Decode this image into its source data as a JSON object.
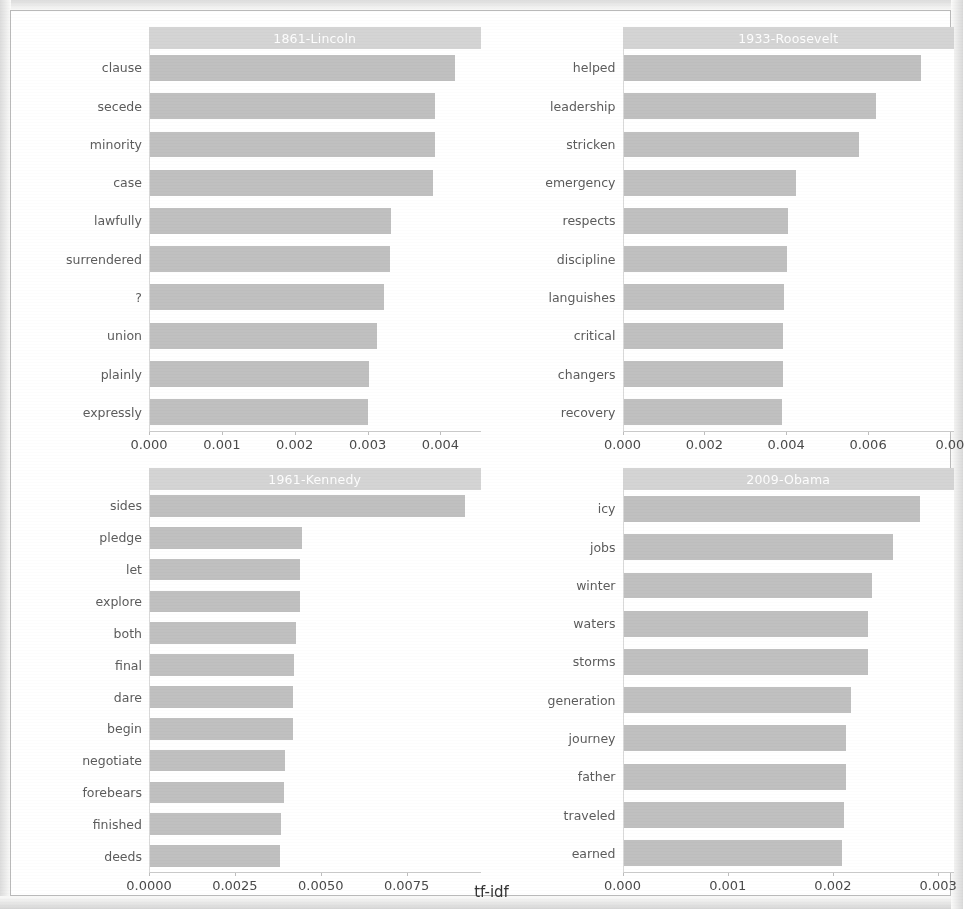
{
  "figure": {
    "axis_title": "tf-idf",
    "bar_color": "#c0c0c0",
    "strip_color": "#d4d4d4",
    "strip_text_color": "#ffffff",
    "background": "#ffffff"
  },
  "chart_data": [
    {
      "type": "bar",
      "orientation": "horizontal",
      "title": "1861-Lincoln",
      "xlabel": "tf-idf",
      "ylabel": "",
      "xlim": [
        0,
        0.00455
      ],
      "xticks": [
        0.0,
        0.001,
        0.002,
        0.003,
        0.004
      ],
      "xticklabels": [
        "0.000",
        "0.001",
        "0.002",
        "0.003",
        "0.004"
      ],
      "grid": false,
      "categories": [
        "clause",
        "secede",
        "minority",
        "case",
        "lawfully",
        "surrendered",
        "?",
        "union",
        "plainly",
        "expressly"
      ],
      "values": [
        0.0042,
        0.00393,
        0.00393,
        0.0039,
        0.00332,
        0.0033,
        0.00322,
        0.00312,
        0.00302,
        0.003
      ]
    },
    {
      "type": "bar",
      "orientation": "horizontal",
      "title": "1933-Roosevelt",
      "xlabel": "tf-idf",
      "ylabel": "",
      "xlim": [
        0,
        0.0081
      ],
      "xticks": [
        0.0,
        0.002,
        0.004,
        0.006,
        0.008
      ],
      "xticklabels": [
        "0.000",
        "0.002",
        "0.004",
        "0.006",
        "0.00"
      ],
      "grid": false,
      "categories": [
        "helped",
        "leadership",
        "stricken",
        "emergency",
        "respects",
        "discipline",
        "languishes",
        "critical",
        "changers",
        "recovery"
      ],
      "values": [
        0.0073,
        0.0062,
        0.00578,
        0.00422,
        0.00402,
        0.004,
        0.00393,
        0.0039,
        0.0039,
        0.00388
      ]
    },
    {
      "type": "bar",
      "orientation": "horizontal",
      "title": "1961-Kennedy",
      "xlabel": "tf-idf",
      "ylabel": "",
      "xlim": [
        0,
        0.00965
      ],
      "xticks": [
        0.0,
        0.0025,
        0.005,
        0.0075
      ],
      "xticklabels": [
        "0.0000",
        "0.0025",
        "0.0050",
        "0.0075"
      ],
      "grid": false,
      "categories": [
        "sides",
        "pledge",
        "let",
        "explore",
        "both",
        "final",
        "dare",
        "begin",
        "negotiate",
        "forebears",
        "finished",
        "deeds"
      ],
      "values": [
        0.0092,
        0.00443,
        0.00438,
        0.00438,
        0.00425,
        0.0042,
        0.00418,
        0.00418,
        0.00393,
        0.0039,
        0.00382,
        0.0038
      ]
    },
    {
      "type": "bar",
      "orientation": "horizontal",
      "title": "2009-Obama",
      "xlabel": "tf-idf",
      "ylabel": "",
      "xlim": [
        0,
        0.00315
      ],
      "xticks": [
        0.0,
        0.001,
        0.002,
        0.003
      ],
      "xticklabels": [
        "0.000",
        "0.001",
        "0.002",
        "0.003"
      ],
      "grid": false,
      "categories": [
        "icy",
        "jobs",
        "winter",
        "waters",
        "storms",
        "generation",
        "journey",
        "father",
        "traveled",
        "earned"
      ],
      "values": [
        0.00283,
        0.00257,
        0.00237,
        0.00233,
        0.00233,
        0.00217,
        0.00212,
        0.00212,
        0.0021,
        0.00208
      ]
    }
  ]
}
